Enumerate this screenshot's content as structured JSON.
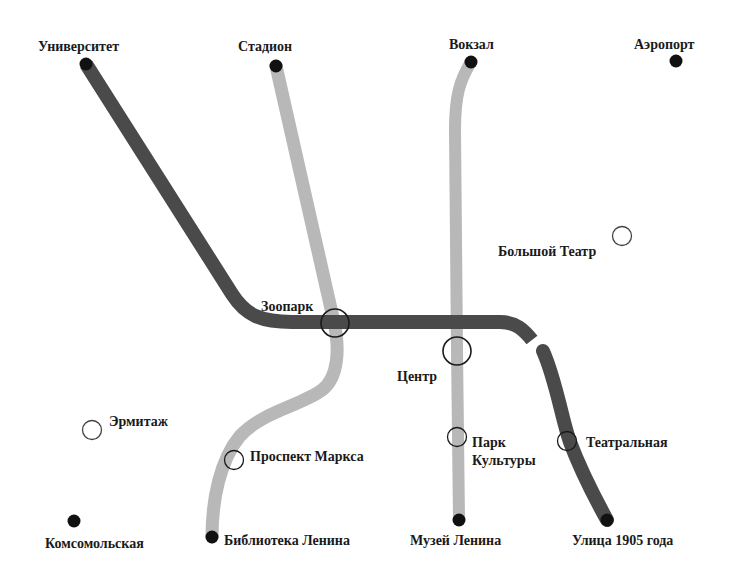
{
  "map": {
    "colors": {
      "dark_line": "#4a4a4a",
      "light_line": "#b8b8b8",
      "terminal": "#111111",
      "interchange_ring": "#1a1a1a",
      "background": "#ffffff"
    },
    "lines": [
      {
        "id": "dark",
        "color": "#4a4a4a",
        "stations": [
          "Университет",
          "Зоопарк",
          "Центр",
          "Театральная",
          "Улица 1905 года"
        ]
      },
      {
        "id": "light-west",
        "color": "#b8b8b8",
        "stations": [
          "Стадион",
          "Зоопарк",
          "Проспект Маркса",
          "Библиотека Ленина"
        ]
      },
      {
        "id": "light-central",
        "color": "#b8b8b8",
        "stations": [
          "Вокзал",
          "Центр",
          "Парк Культуры",
          "Музей Ленина"
        ]
      }
    ],
    "stations": {
      "universitet": {
        "label": "Университет",
        "type": "terminal"
      },
      "stadion": {
        "label": "Стадион",
        "type": "terminal"
      },
      "vokzal": {
        "label": "Вокзал",
        "type": "terminal"
      },
      "aeroport": {
        "label": "Аэропорт",
        "type": "terminal"
      },
      "bolshoi": {
        "label": "Большой Театр",
        "type": "open"
      },
      "zoopark": {
        "label": "Зоопарк",
        "type": "interchange"
      },
      "tsentr": {
        "label": "Центр",
        "type": "interchange"
      },
      "ermitazh": {
        "label": "Эрмитаж",
        "type": "open"
      },
      "prospekt": {
        "label": "Проспект Маркса",
        "type": "open"
      },
      "park_line1": {
        "label": "Парк"
      },
      "park_line2": {
        "label": "Культуры"
      },
      "park": {
        "type": "open"
      },
      "teatralnaya": {
        "label": "Театральная",
        "type": "open"
      },
      "komsomolskaya": {
        "label": "Комсомольская",
        "type": "terminal"
      },
      "biblioteka": {
        "label": "Библиотека Ленина",
        "type": "terminal"
      },
      "muzei": {
        "label": "Музей Ленина",
        "type": "terminal"
      },
      "ulitsa": {
        "label": "Улица 1905 года",
        "type": "terminal"
      }
    }
  }
}
